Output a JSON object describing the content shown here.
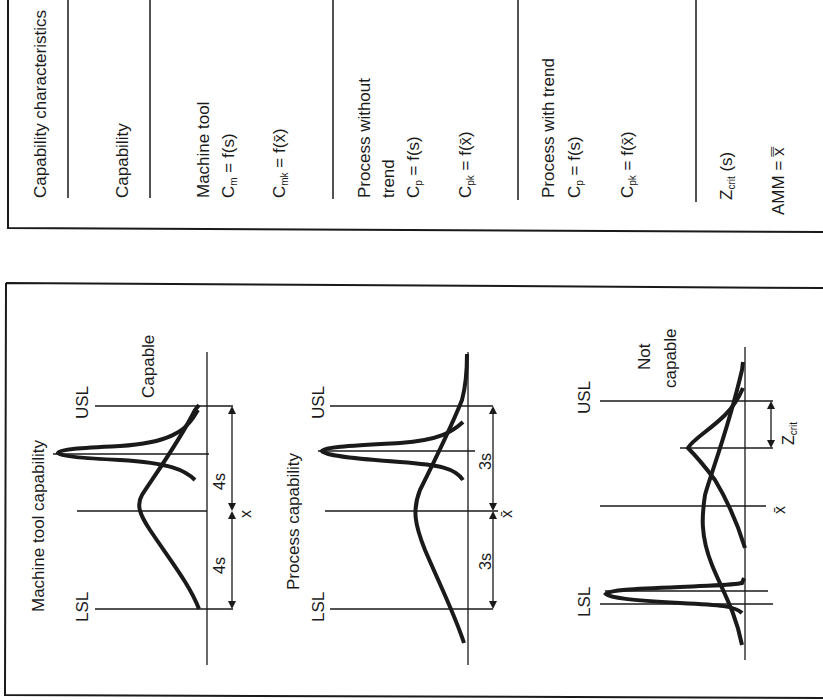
{
  "table": {
    "header": "Capability characteristics",
    "rows": [
      {
        "label": "Capability"
      },
      {
        "label": "Machine tool",
        "f1_sym": "C",
        "f1_sub": "m",
        "f1_rest": " = f(s)",
        "f2_sym": "C",
        "f2_sub": "mk",
        "f2_rest": " = f(x̄)"
      },
      {
        "label": "Process without",
        "label2": "trend",
        "f1_sym": "C",
        "f1_sub": "p",
        "f1_rest": " = f(s)",
        "f2_sym": "C",
        "f2_sub": "pk",
        "f2_rest": " = f(x̄)"
      },
      {
        "label": "Process with trend",
        "f1_sym": "C",
        "f1_sub": "p",
        "f1_rest": " = f(s)",
        "f2_sym": "C",
        "f2_sub": "pk",
        "f2_rest": " = f(x̄)"
      },
      {
        "z_sym": "Z",
        "z_sub": "crit",
        "z_rest": " (s)",
        "amm": "AMM = x̿"
      }
    ]
  },
  "panels": [
    {
      "title": "Machine tool capability",
      "status": "Capable",
      "lsl": "LSL",
      "usl": "USL",
      "spread_label": "4s",
      "center_label": "x"
    },
    {
      "title": "Process capability",
      "lsl": "LSL",
      "usl": "USL",
      "spread_label": "3s",
      "center_label": "x̄"
    },
    {
      "status_line1": "Not",
      "status_line2": "capable",
      "lsl": "LSL",
      "usl": "USL",
      "center_label": "x̄",
      "zcrit_sym": "Z",
      "zcrit_sub": "crit"
    }
  ]
}
